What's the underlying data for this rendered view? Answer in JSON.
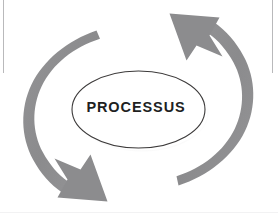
{
  "diagram": {
    "type": "cycle",
    "center_label": "PROCESSUS",
    "arc_count": 2,
    "arrow_count": 2,
    "direction": "counter-clockwise",
    "colors": {
      "arc_fill": "#8c8c8e",
      "arc_fill_light": "#9a9a9c",
      "ellipse_fill": "#ffffff",
      "ellipse_stroke": "#3c3a3a",
      "ellipse_shadow": "#9b9b9d",
      "label_text": "#211f1f",
      "frame_line": "#b9b9bb",
      "background": "#ffffff"
    },
    "arcs": [
      {
        "name": "left-arc",
        "position": "left",
        "starts": "top",
        "ends": "bottom",
        "arrowhead": "bottom-pointing-down-right"
      },
      {
        "name": "right-arc",
        "position": "right",
        "starts": "bottom",
        "ends": "top",
        "arrowhead": "top-pointing-up-left"
      }
    ]
  },
  "frame": {
    "left_rule": "vertical-page-rule",
    "right_rule": "vertical-page-rule",
    "bottom_rule": "horizontal-page-rule"
  }
}
